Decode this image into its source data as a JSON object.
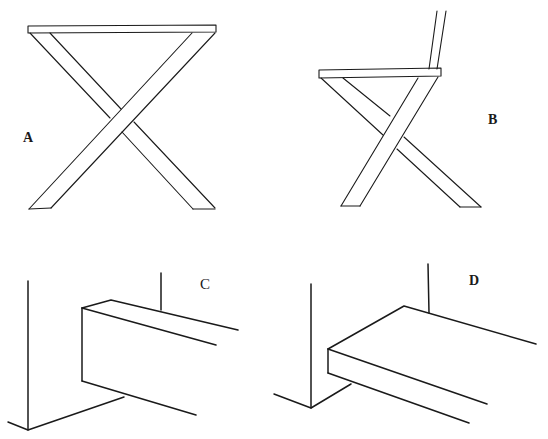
{
  "figure": {
    "panels": [
      {
        "id": "A",
        "label": "A",
        "description": "Front view of X-frame stool/table with flat top"
      },
      {
        "id": "B",
        "label": "B",
        "description": "Side view of X-frame chair with seat and backrest"
      },
      {
        "id": "C",
        "label": "C",
        "description": "Joint detail: rectangular beam meeting wall corner"
      },
      {
        "id": "D",
        "label": "D",
        "description": "Joint detail: flat board meeting wall corner"
      }
    ]
  },
  "colors": {
    "line": "#1a1a1a",
    "background": "#ffffff"
  }
}
